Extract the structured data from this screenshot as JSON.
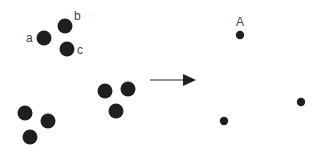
{
  "diagram": {
    "colors": {
      "dot": "#1f1f1f",
      "arrow": "#222222",
      "label": "#444444",
      "background": "#ffffff"
    },
    "left_panel": {
      "clusters": [
        {
          "name": "labeled-cluster",
          "points": [
            {
              "label": "a"
            },
            {
              "label": "b"
            },
            {
              "label": "c"
            }
          ]
        },
        {
          "name": "bottom-left-cluster",
          "points": [
            {
              "label": ""
            },
            {
              "label": ""
            },
            {
              "label": ""
            }
          ]
        },
        {
          "name": "middle-cluster",
          "points": [
            {
              "label": ""
            },
            {
              "label": ""
            },
            {
              "label": ""
            }
          ]
        }
      ]
    },
    "arrow": {
      "direction": "right"
    },
    "right_panel": {
      "points": [
        {
          "label": "A"
        },
        {
          "label": ""
        },
        {
          "label": ""
        }
      ]
    }
  }
}
